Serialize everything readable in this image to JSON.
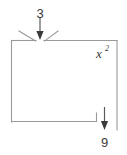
{
  "diagram": {
    "type": "function-machine-block-diagram",
    "title": "",
    "input": {
      "label": "3",
      "position": "top",
      "arrow_direction": "down"
    },
    "machine": {
      "label": "x",
      "exponent": "2",
      "label_full": "x²",
      "shape": "rectangle"
    },
    "output": {
      "label": "9",
      "position": "bottom-right",
      "arrow_direction": "down"
    },
    "colors": {
      "box_stroke": "#9a9a9a",
      "arrow_stroke": "#3a3a3a",
      "text": "#3a3a3a",
      "background": "#ffffff"
    }
  }
}
